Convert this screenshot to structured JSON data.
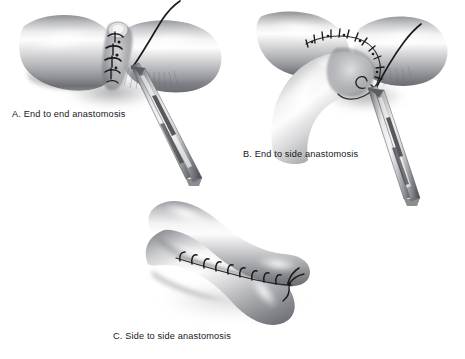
{
  "figure": {
    "background_color": "#ffffff",
    "ink_color": "#16181a",
    "tissue_light": "#fbfbfb",
    "tissue_mid": "#c9c9cb",
    "tissue_dark": "#7e8084",
    "tissue_shadow": "#4b4d51",
    "suture_color": "#1a1a1c",
    "instrument_light": "#e9e9ea",
    "instrument_mid": "#a9abae",
    "instrument_dark": "#3a3c40",
    "style": "grayscale airbrush medical illustration",
    "panel_count": 3
  },
  "panels": [
    {
      "id": "A",
      "label": "A.  End to end anastomosis",
      "letter": "A",
      "name": "End to end anastomosis",
      "description": "Two cut vessel ends joined directly end to end with interrupted sutures; a needle holder grasps the suture thread.",
      "vessel_arrangement": "single horizontal tube severed and rejoined at center",
      "suture_type": "interrupted vertical stitches",
      "stitch_count": 5,
      "has_instrument": true,
      "instrument": "needle-holder",
      "has_suture_tail": true
    },
    {
      "id": "B",
      "label": "B.  End to side anastomosis",
      "letter": "B",
      "name": "End to side anastomosis",
      "description": "Cut end of a branch vessel sewn onto the side wall of a main vessel with a curved running suture line; needle holder grasps the thread.",
      "vessel_arrangement": "horizontal main trunk with curved branch joining from below",
      "suture_type": "curved running suture around oval anastomosis",
      "stitch_count": 13,
      "has_instrument": true,
      "instrument": "needle-holder",
      "has_suture_tail": true
    },
    {
      "id": "C",
      "label": "C. Side to side anastomosis",
      "letter": "C",
      "name": "Side to side anastomosis",
      "description": "Two vessels laid across one another and joined along their adjacent side walls with a line of interrupted sutures and a terminal knot.",
      "vessel_arrangement": "two tubes crossing in a scissor formation",
      "suture_type": "interrupted stitches along longitudinal seam with end knot",
      "stitch_count": 9,
      "has_instrument": false,
      "instrument": "",
      "has_suture_tail": true
    }
  ]
}
